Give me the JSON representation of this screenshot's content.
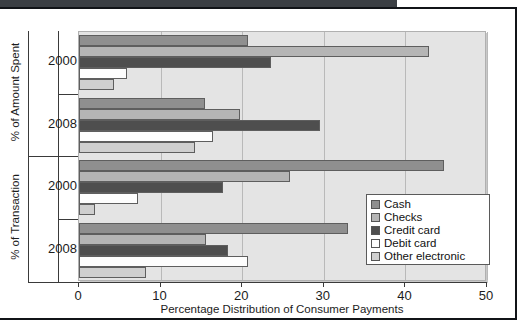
{
  "figure": {
    "background_color": "#ffffff",
    "top_band_color": "#3b3f44",
    "frame_color": "#111418",
    "plot_background": "#e4e4e4"
  },
  "chart_data": {
    "type": "bar",
    "orientation": "horizontal",
    "title": "",
    "xlabel": "Percentage Distribution of Consumer Payments",
    "ylabel": "",
    "xlim": [
      0,
      50
    ],
    "xticks": [
      0,
      10,
      20,
      30,
      40,
      50
    ],
    "xticklabels": [
      "0",
      "10",
      "20",
      "30",
      "40",
      "50"
    ],
    "grid": true,
    "grid_axis": "x",
    "legend_position": "center right",
    "legend_entries": [
      "Cash",
      "Checks",
      "Credit card",
      "Debit card",
      "Other electronic"
    ],
    "series_colors": [
      "#8f8f8f",
      "#b5b5b5",
      "#4e4e4e",
      "#fdfdfd",
      "#cfcfcf"
    ],
    "panel_labels": [
      "% of Amount Spent",
      "% of Transaction"
    ],
    "categories": [
      "2000",
      "2008",
      "2000",
      "2008"
    ],
    "groups": [
      {
        "panel": "% of Amount Spent",
        "year": "2000",
        "values": {
          "Cash": 20.7,
          "Checks": 42.9,
          "Credit card": 23.5,
          "Debit card": 5.9,
          "Other electronic": 4.3
        }
      },
      {
        "panel": "% of Amount Spent",
        "year": "2008",
        "values": {
          "Cash": 15.5,
          "Checks": 19.7,
          "Credit card": 29.5,
          "Debit card": 16.4,
          "Other electronic": 14.2
        }
      },
      {
        "panel": "% of Transaction",
        "year": "2000",
        "values": {
          "Cash": 44.7,
          "Checks": 25.8,
          "Credit card": 17.7,
          "Debit card": 7.2,
          "Other electronic": 1.9
        }
      },
      {
        "panel": "% of Transaction",
        "year": "2008",
        "values": {
          "Cash": 33.0,
          "Checks": 15.6,
          "Credit card": 18.3,
          "Debit card": 20.7,
          "Other electronic": 8.2
        }
      }
    ],
    "series": [
      {
        "name": "Cash",
        "values": [
          20.7,
          15.5,
          44.7,
          33.0
        ]
      },
      {
        "name": "Checks",
        "values": [
          42.9,
          19.7,
          25.8,
          15.6
        ]
      },
      {
        "name": "Credit card",
        "values": [
          23.5,
          29.5,
          17.7,
          18.3
        ]
      },
      {
        "name": "Debit card",
        "values": [
          5.9,
          16.4,
          7.2,
          20.7
        ]
      },
      {
        "name": "Other electronic",
        "values": [
          4.3,
          14.2,
          1.9,
          8.2
        ]
      }
    ]
  },
  "axis": {
    "x_label": "Percentage Distribution of Consumer Payments",
    "tick_0": "0",
    "tick_1": "10",
    "tick_2": "20",
    "tick_3": "30",
    "tick_4": "40",
    "tick_5": "50",
    "group_label_1": "2000",
    "group_label_2": "2008",
    "group_label_3": "2000",
    "group_label_4": "2008",
    "panel_label_top": "% of Amount Spent",
    "panel_label_bottom": "% of Transaction"
  },
  "legend": {
    "items": [
      {
        "label": "Cash",
        "color": "#8f8f8f"
      },
      {
        "label": "Checks",
        "color": "#b5b5b5"
      },
      {
        "label": "Credit card",
        "color": "#4e4e4e"
      },
      {
        "label": "Debit card",
        "color": "#fdfdfd"
      },
      {
        "label": "Other electronic",
        "color": "#cfcfcf"
      }
    ]
  }
}
